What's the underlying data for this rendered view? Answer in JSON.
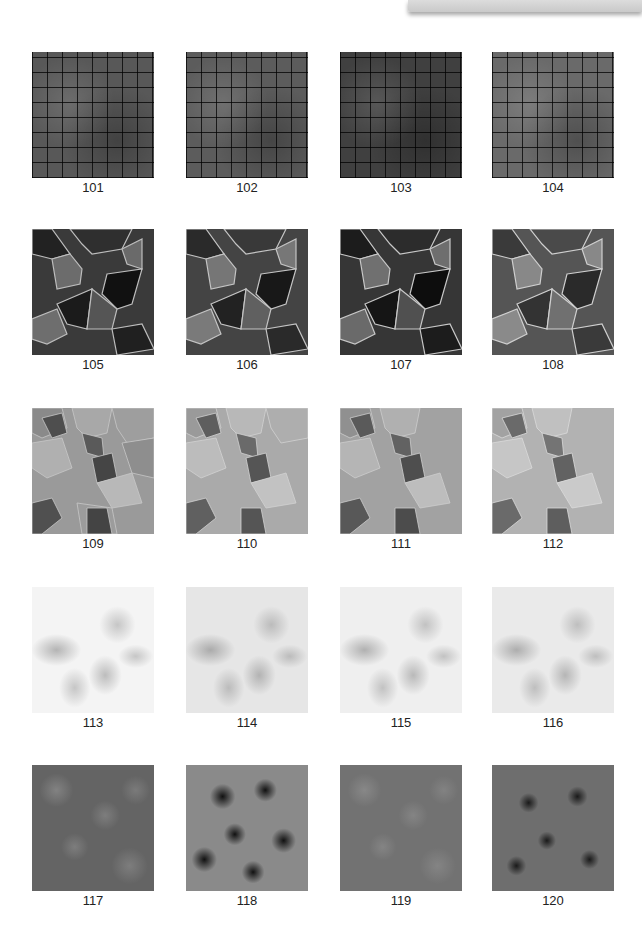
{
  "page": {
    "header_tab": "",
    "layout": {
      "columns": 4,
      "rows": 5
    }
  },
  "grid": {
    "rows": [
      {
        "style": "herringbone-brick",
        "tiles": [
          {
            "label": "101",
            "tone": "#585858"
          },
          {
            "label": "102",
            "tone": "#5c5c5c"
          },
          {
            "label": "103",
            "tone": "#404040"
          },
          {
            "label": "104",
            "tone": "#6a6a6a"
          }
        ]
      },
      {
        "style": "voronoi-stone-dark",
        "tiles": [
          {
            "label": "105"
          },
          {
            "label": "106"
          },
          {
            "label": "107"
          },
          {
            "label": "108"
          }
        ]
      },
      {
        "style": "voronoi-stone-light",
        "tiles": [
          {
            "label": "109"
          },
          {
            "label": "110"
          },
          {
            "label": "111"
          },
          {
            "label": "112"
          }
        ]
      },
      {
        "style": "marble-white",
        "tiles": [
          {
            "label": "113"
          },
          {
            "label": "114"
          },
          {
            "label": "115"
          },
          {
            "label": "116"
          }
        ]
      },
      {
        "style": "granite",
        "tiles": [
          {
            "label": "117"
          },
          {
            "label": "118"
          },
          {
            "label": "119"
          },
          {
            "label": "120"
          }
        ]
      }
    ]
  }
}
